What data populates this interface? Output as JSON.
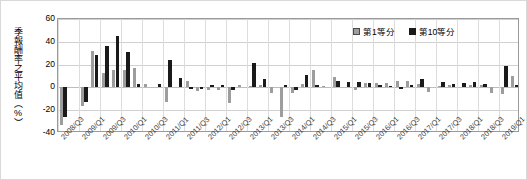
{
  "chart_data": {
    "type": "bar",
    "title": "",
    "xlabel": "",
    "ylabel": "季報酬率之平均值（%）",
    "ylim": [
      -40,
      60
    ],
    "ytick_values": [
      60,
      40,
      20,
      0,
      -20,
      -40
    ],
    "ytick_labels": [
      "60",
      "40",
      "20",
      "0",
      "-20",
      "-40"
    ],
    "grid": true,
    "legend_position": "top-right",
    "categories": [
      "2008/Q3",
      "2008/Q4",
      "2009/Q1",
      "2009/Q2",
      "2009/Q3",
      "2009/Q4",
      "2010/Q1",
      "2010/Q2",
      "2010/Q3",
      "2010/Q4",
      "2011/Q1",
      "2011/Q2",
      "2011/Q3",
      "2011/Q4",
      "2012/Q1",
      "2012/Q2",
      "2012/Q3",
      "2012/Q4",
      "2013/Q1",
      "2013/Q2",
      "2013/Q3",
      "2013/Q4",
      "2014/Q1",
      "2014/Q2",
      "2014/Q3",
      "2014/Q4",
      "2015/Q1",
      "2015/Q2",
      "2015/Q3",
      "2015/Q4",
      "2016/Q1",
      "2016/Q2",
      "2016/Q3",
      "2016/Q4",
      "2017/Q1",
      "2017/Q2",
      "2017/Q3",
      "2017/Q4",
      "2018/Q1",
      "2018/Q2",
      "2018/Q3",
      "2018/Q4",
      "2019/Q1",
      "2019/Q2"
    ],
    "xtick_labels": [
      "2008/Q3",
      "2009/Q1",
      "2009/Q3",
      "2010/Q1",
      "2010/Q3",
      "2011/Q1",
      "2011/Q3",
      "2012/Q1",
      "2012/Q3",
      "2013/Q1",
      "2013/Q3",
      "2014/Q1",
      "2014/Q3",
      "2015/Q1",
      "2015/Q3",
      "2016/Q1",
      "2016/Q3",
      "2017/Q1",
      "2017/Q3",
      "2018/Q1",
      "2018/Q3",
      "2019/Q1"
    ],
    "series": [
      {
        "name": "第1等分",
        "color": "#9d9d9d",
        "values": [
          -33,
          0,
          -16,
          32,
          13,
          15,
          15,
          17,
          3,
          0,
          -13,
          0,
          6,
          -3,
          -2,
          -2,
          -14,
          2,
          1,
          2,
          -5,
          -26,
          -5,
          3,
          15,
          1,
          9,
          0,
          -2,
          4,
          4,
          4,
          6,
          6,
          3,
          -4,
          1,
          2,
          0,
          2,
          2,
          -5,
          -6,
          10
        ]
      },
      {
        "name": "第10等分",
        "color": "#1a1a1a",
        "values": [
          -26,
          0,
          -13,
          28,
          36,
          45,
          31,
          3,
          0,
          3,
          24,
          8,
          -1,
          -1,
          2,
          2,
          -2,
          0,
          21,
          7,
          0,
          2,
          -2,
          11,
          2,
          0,
          6,
          5,
          5,
          4,
          2,
          1,
          -1,
          2,
          7,
          0,
          5,
          3,
          4,
          5,
          3,
          0,
          19,
          2
        ]
      }
    ]
  },
  "legend": {
    "items": [
      {
        "label": "第1等分"
      },
      {
        "label": "第10等分"
      }
    ]
  }
}
